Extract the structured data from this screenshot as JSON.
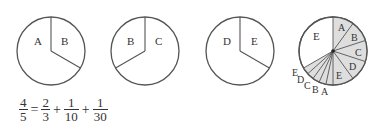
{
  "diagram": {
    "type": "pie-fraction-illustration",
    "pies": [
      {
        "id": "pie-1",
        "labels": [
          "A",
          "B"
        ],
        "divisions": "2/3 and 1/3",
        "shaded": false
      },
      {
        "id": "pie-2",
        "labels": [
          "B",
          "C"
        ],
        "divisions": "1/3 and 2/3",
        "shaded": false
      },
      {
        "id": "pie-3",
        "labels": [
          "D",
          "E"
        ],
        "divisions": "2/3 and 1/3",
        "shaded": false
      },
      {
        "id": "pie-4",
        "labels_inside": [
          "E",
          "A",
          "B",
          "C",
          "D",
          "E"
        ],
        "labels_outside": [
          "E",
          "D",
          "C",
          "B",
          "A"
        ],
        "shaded_color": "#dedede",
        "description": "Large unshaded E sector; five shaded 1/10 sectors A–E on the right; five thin shaded 1/30 sectors labeled E, D, C, B, A outside"
      }
    ],
    "labels": {
      "p1a": "A",
      "p1b": "B",
      "p2b": "B",
      "p2c": "C",
      "p3d": "D",
      "p3e": "E",
      "p4_big": "E",
      "p4_in": [
        "A",
        "B",
        "C",
        "D",
        "E"
      ],
      "p4_out": [
        "E",
        "D",
        "C",
        "B",
        "A"
      ]
    }
  },
  "equation": {
    "lhs": {
      "num": "4",
      "den": "5"
    },
    "eq": "=",
    "terms": [
      {
        "num": "2",
        "den": "3"
      },
      {
        "num": "1",
        "den": "10"
      },
      {
        "num": "1",
        "den": "30"
      }
    ],
    "plus": "+"
  },
  "colors": {
    "stroke": "#555555",
    "shade": "#dedede"
  }
}
